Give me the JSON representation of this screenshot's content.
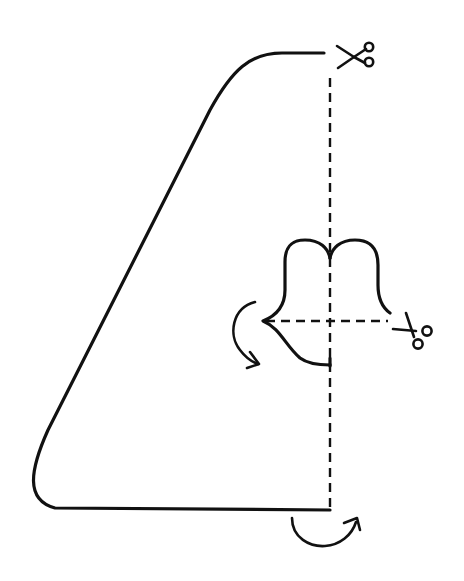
{
  "diagram": {
    "stroke_color": "#111111",
    "background_color": "#ffffff",
    "elements": {
      "outline": "cut-line-outer-shape",
      "fold_line_vertical": "dashed-fold-line",
      "fold_line_horizontal": "dashed-fold-line",
      "bell_shape": "cut-line-inner-shape",
      "scissors": [
        "scissors-icon-top",
        "scissors-icon-right"
      ],
      "arrows": [
        "fold-arrow-left",
        "fold-arrow-bottom"
      ]
    }
  }
}
